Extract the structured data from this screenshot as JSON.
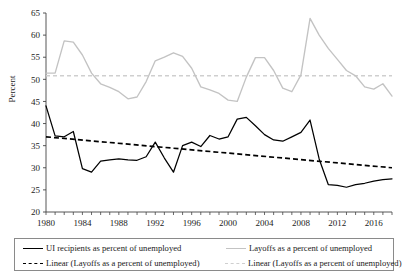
{
  "axes": {
    "ylabel": "Percent",
    "ytick_labels": [
      "65",
      "60",
      "55",
      "50",
      "45",
      "40",
      "35",
      "30",
      "25",
      "20"
    ],
    "xtick_labels": [
      "1980",
      "1984",
      "1988",
      "1992",
      "1996",
      "2000",
      "2004",
      "2008",
      "2012",
      "2016"
    ]
  },
  "legend": {
    "items": [
      {
        "id": "ui-recipients",
        "style": "solid-black",
        "label": "UI recipients as percent of unemployed"
      },
      {
        "id": "layoffs",
        "style": "solid-gray",
        "label": "Layoffs as a percent of unemployed"
      },
      {
        "id": "linear-ui",
        "style": "dash-black",
        "label": "Linear (Layoffs as a percent of unemployed)"
      },
      {
        "id": "linear-layoffs",
        "style": "dash-gray",
        "label": "Linear (Layoffs as a percent of unemployed)"
      }
    ]
  },
  "colors": {
    "series_ui": "#000000",
    "series_layoffs": "#c3c3c3",
    "trend_ui": "#000000",
    "trend_layoffs": "#cfcfcf",
    "axis": "#444444"
  },
  "chart_data": {
    "type": "line",
    "title": "",
    "xlabel": "",
    "ylabel": "Percent",
    "xlim": [
      1980,
      2018
    ],
    "ylim": [
      20,
      65
    ],
    "ytick_step": 5,
    "xtick_step": 1,
    "xtick_label_step": 4,
    "grid": false,
    "legend_position": "bottom",
    "x": [
      1980,
      1981,
      1982,
      1983,
      1984,
      1985,
      1986,
      1987,
      1988,
      1989,
      1990,
      1991,
      1992,
      1993,
      1994,
      1995,
      1996,
      1997,
      1998,
      1999,
      2000,
      2001,
      2002,
      2003,
      2004,
      2005,
      2006,
      2007,
      2008,
      2009,
      2010,
      2011,
      2012,
      2013,
      2014,
      2015,
      2016,
      2017,
      2018
    ],
    "series": [
      {
        "name": "UI recipients as percent of unemployed",
        "style": "solid",
        "color": "#000000",
        "values": [
          44.0,
          37.2,
          37.0,
          38.2,
          29.8,
          29.0,
          31.5,
          31.8,
          32.0,
          31.8,
          31.7,
          32.5,
          35.8,
          32.2,
          29.0,
          35.0,
          35.8,
          34.8,
          37.3,
          36.5,
          37.0,
          41.0,
          41.4,
          39.5,
          37.5,
          36.3,
          36.0,
          37.0,
          38.0,
          40.8,
          32.0,
          26.2,
          26.0,
          25.6,
          26.2,
          26.5,
          27.0,
          27.3,
          27.5
        ]
      },
      {
        "name": "Layoffs as a percent of unemployed",
        "style": "solid",
        "color": "#c3c3c3",
        "values": [
          51.4,
          51.4,
          58.7,
          58.4,
          55.5,
          51.4,
          49.0,
          48.2,
          47.2,
          45.6,
          46.0,
          49.5,
          54.2,
          55.0,
          56.0,
          55.2,
          52.5,
          48.3,
          47.6,
          46.8,
          45.3,
          45.0,
          50.5,
          54.9,
          54.9,
          52.0,
          48.0,
          47.2,
          51.0,
          63.8,
          60.0,
          57.0,
          54.5,
          52.0,
          50.8,
          48.3,
          47.8,
          49.0,
          46.2
        ]
      }
    ],
    "trendlines": [
      {
        "name": "Linear (Layoffs as a percent of unemployed)",
        "style": "dashed",
        "color": "#000000",
        "x": [
          1980,
          2018
        ],
        "y": [
          37.0,
          30.0
        ]
      },
      {
        "name": "Linear (Layoffs as a percent of unemployed)",
        "style": "dashed",
        "color": "#cfcfcf",
        "x": [
          1980,
          2018
        ],
        "y": [
          50.8,
          50.8
        ]
      }
    ]
  }
}
